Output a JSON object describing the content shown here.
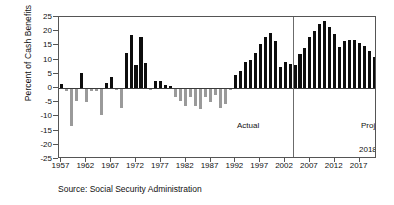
{
  "chart_data": {
    "type": "bar",
    "title": "",
    "xlabel": "",
    "ylabel": "Percent of Cash Benefits",
    "ylim": [
      -25,
      25
    ],
    "ytick_step": 5,
    "yticks": [
      25,
      20,
      15,
      10,
      5,
      0,
      -5,
      -10,
      -15,
      -20,
      -25
    ],
    "xlim": [
      1956.5,
      2020.5
    ],
    "xticks": [
      1957,
      1962,
      1967,
      1972,
      1977,
      1982,
      1987,
      1992,
      1997,
      2002,
      2007,
      2012,
      2017
    ],
    "grid": false,
    "legend": null,
    "colors": {
      "positive_bar": "#0d0d0d",
      "negative_bar": "#9a9a9a",
      "frame": "#555555",
      "divider": "#6b6b6b"
    },
    "x": [
      1957,
      1958,
      1959,
      1960,
      1961,
      1962,
      1963,
      1964,
      1965,
      1966,
      1967,
      1968,
      1969,
      1970,
      1971,
      1972,
      1973,
      1974,
      1975,
      1976,
      1977,
      1978,
      1979,
      1980,
      1981,
      1982,
      1983,
      1984,
      1985,
      1986,
      1987,
      1988,
      1989,
      1990,
      1991,
      1992,
      1993,
      1994,
      1995,
      1996,
      1997,
      1998,
      1999,
      2000,
      2001,
      2002,
      2003,
      2004,
      2005,
      2006,
      2007,
      2008,
      2009,
      2010,
      2011,
      2012,
      2013,
      2014,
      2015,
      2016,
      2017,
      2018,
      2019,
      2020
    ],
    "values": [
      1.5,
      -1.0,
      -13.5,
      -4.5,
      5.3,
      -5.0,
      -1.0,
      -1.0,
      -9.5,
      1.6,
      3.8,
      -0.8,
      -7.0,
      12.5,
      18.8,
      8.2,
      17.8,
      8.8,
      -0.6,
      2.6,
      2.4,
      1.0,
      0.7,
      -3.0,
      -4.5,
      -6.5,
      -3.0,
      -6.2,
      -7.5,
      -3.0,
      -5.0,
      -2.5,
      -7.0,
      -5.5,
      -0.7,
      4.5,
      6.0,
      9.2,
      10.0,
      12.5,
      15.5,
      18.0,
      19.5,
      16.5,
      7.5,
      9.0,
      8.5,
      8.0,
      12.0,
      14.0,
      18.0,
      20.0,
      22.5,
      23.5,
      21.5,
      19.0,
      14.5,
      16.5,
      17.0,
      16.8,
      16.0,
      14.8,
      13.2,
      11.0
    ],
    "series_note": "Annual OASDI cash-flow balance as percent of cash benefits; actual through 2003, projected thereafter",
    "annotations": [
      {
        "text": "Actual",
        "x": 1992,
        "y": -11
      },
      {
        "text": "Projected",
        "x": 2008,
        "y": -11
      },
      {
        "text": "2018 \"crisis\"?",
        "x": 2008,
        "y": -19
      }
    ],
    "divider_x": 2003.5,
    "divider_label": "boundary between actual and projected values"
  },
  "figure": {
    "ylabel": "Percent of Cash Benefits",
    "source": "Source: Social Security Administration",
    "annot_actual": "Actual",
    "annot_projected": "Projected",
    "annot_crisis": "2018 \"crisis\"?"
  }
}
